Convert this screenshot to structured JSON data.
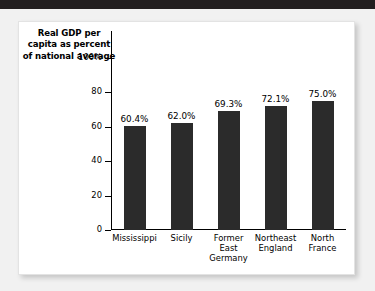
{
  "figure": {
    "axis_title_lines": [
      "Real GDP per",
      "capita as percent",
      "of national average"
    ]
  },
  "chart_data": {
    "type": "bar",
    "title": "Real GDP per capita as percent of national average",
    "xlabel": "",
    "ylabel": "Real GDP per capita as percent of national average",
    "ylim": [
      0,
      100
    ],
    "yticks": [
      0,
      20,
      40,
      60,
      80,
      100
    ],
    "ytick_labels": [
      "0",
      "20",
      "40",
      "60",
      "80",
      "100%"
    ],
    "grid": false,
    "legend": false,
    "bar_color": "#2b2b2b",
    "categories": [
      "Mississippi",
      "Sicily",
      "Former East Germany",
      "Northeast England",
      "North France"
    ],
    "category_label_lines": [
      [
        "Mississippi"
      ],
      [
        "Sicily"
      ],
      [
        "Former",
        "East",
        "Germany"
      ],
      [
        "Northeast",
        "England"
      ],
      [
        "North",
        "France"
      ]
    ],
    "values": [
      60.4,
      62.0,
      69.3,
      72.1,
      75.0
    ],
    "value_labels": [
      "60.4%",
      "62.0%",
      "69.3%",
      "72.1%",
      "75.0%"
    ]
  }
}
